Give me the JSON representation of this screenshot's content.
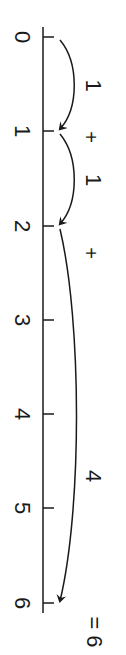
{
  "diagram": {
    "title": "",
    "type": "number-line-addition",
    "orientation": "rotated 90deg clockwise",
    "ticks": [
      {
        "value": "0",
        "y": 37
      },
      {
        "value": "1",
        "y": 131
      },
      {
        "value": "2",
        "y": 226
      },
      {
        "value": "3",
        "y": 320
      },
      {
        "value": "4",
        "y": 414
      },
      {
        "value": "5",
        "y": 508
      },
      {
        "value": "6",
        "y": 603
      }
    ],
    "jumps": [
      {
        "from": 0,
        "to": 1,
        "label": "1"
      },
      {
        "from": 1,
        "to": 2,
        "label": "1"
      },
      {
        "from": 2,
        "to": 6,
        "label": "4"
      }
    ],
    "operators": [
      "+",
      "+"
    ],
    "result": "= 6"
  }
}
